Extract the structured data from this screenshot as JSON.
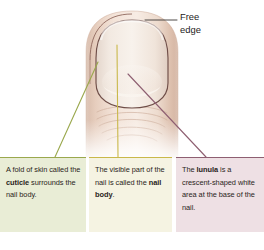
{
  "figure": {
    "labels": {
      "free_edge": "Free\nedge"
    },
    "callouts": [
      {
        "id": "cuticle",
        "name": "callout-cuticle",
        "plain_text": "A fold of skin called the cuticle surrounds the nail body.",
        "segments": [
          {
            "text": "A fold of skin called the ",
            "bold": false
          },
          {
            "text": "cuticle",
            "bold": true
          },
          {
            "text": " surrounds the nail body.",
            "bold": false
          }
        ],
        "fill_color": "#e9edd6",
        "border_color": "#9aa84d"
      },
      {
        "id": "nail-body",
        "name": "callout-nail-body",
        "plain_text": "The visible part of the nail is called the nail body.",
        "segments": [
          {
            "text": "The visible part of the nail is called the ",
            "bold": false
          },
          {
            "text": "nail body",
            "bold": true
          },
          {
            "text": ".",
            "bold": false
          }
        ],
        "fill_color": "#f5f3e2",
        "border_color": "#c9b84a"
      },
      {
        "id": "lunula",
        "name": "callout-lunula",
        "plain_text": "The lunula is a crescent-shaped white area at the base of the nail.",
        "segments": [
          {
            "text": "The ",
            "bold": false
          },
          {
            "text": "lunula",
            "bold": true
          },
          {
            "text": " is a crescent-shaped white area at the base of the nail.",
            "bold": false
          }
        ],
        "fill_color": "#eee0e4",
        "border_color": "#8e5f71"
      }
    ],
    "leader_lines": [
      {
        "name": "leader-line-cuticle",
        "color": "#9aa84d",
        "from": [
          98,
          62
        ],
        "to": [
          55,
          157
        ]
      },
      {
        "name": "leader-line-nail-body",
        "color": "#c9b84a",
        "from": [
          117,
          45
        ],
        "to": [
          118,
          157
        ]
      },
      {
        "name": "leader-line-lunula",
        "color": "#8e5f71",
        "from": [
          128,
          74
        ],
        "to": [
          206,
          157
        ]
      },
      {
        "name": "leader-line-free-edge",
        "color": "#3a3533",
        "from": [
          145,
          20
        ],
        "to": [
          177,
          20
        ]
      }
    ],
    "illustration": {
      "name": "finger-with-nail-illustration",
      "skin_color": "#ead8cc",
      "nail_plate_color": "#f0e6de",
      "lunula_color": "#f6efe9",
      "outline_color": "#7a5a52"
    }
  }
}
